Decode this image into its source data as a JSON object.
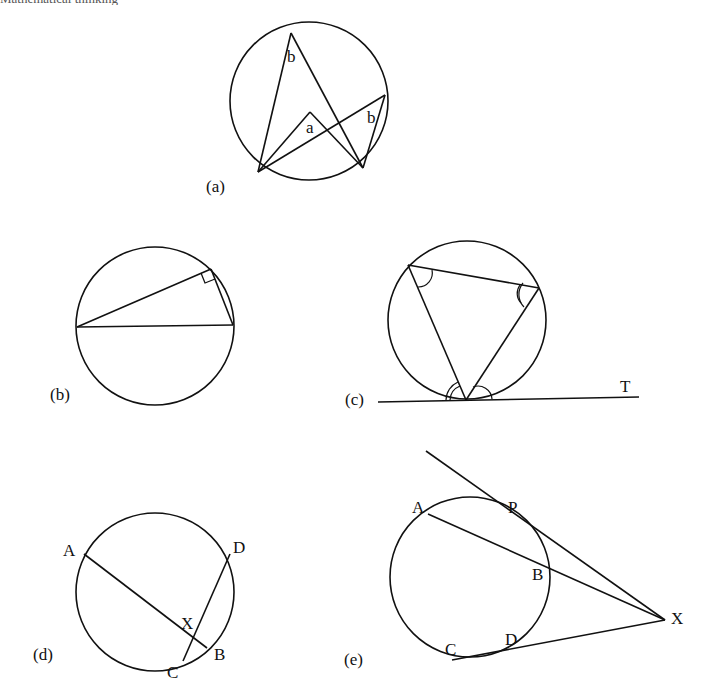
{
  "page": {
    "header_text": "Mathematical thinking",
    "stroke_color": "#111111",
    "background": "#ffffff"
  },
  "figures": {
    "a": {
      "caption": "(a)",
      "description": "Angles subtended by the same arc: angle at centre a, angles at circumference b",
      "labels": {
        "angle_top": "b",
        "angle_right": "b",
        "angle_centre": "a"
      }
    },
    "b": {
      "caption": "(b)",
      "description": "Angle in a semicircle is a right angle"
    },
    "c": {
      "caption": "(c)",
      "description": "Alternate segment theorem with tangent line",
      "labels": {
        "tangent": "T"
      }
    },
    "d": {
      "caption": "(d)",
      "description": "Intersecting chords AB and CD meeting at X",
      "labels": {
        "A": "A",
        "B": "B",
        "C": "C",
        "D": "D",
        "X": "X"
      }
    },
    "e": {
      "caption": "(e)",
      "description": "Secants XA, XC and tangent XP from external point X",
      "labels": {
        "A": "A",
        "B": "B",
        "C": "C",
        "D": "D",
        "P": "P",
        "X": "X"
      }
    }
  }
}
